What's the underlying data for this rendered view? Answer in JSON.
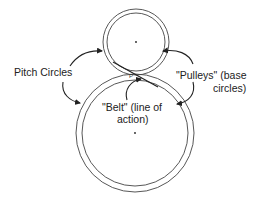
{
  "diagram": {
    "type": "gear pitch circles and base circles with line of action",
    "labels": {
      "pitch_circles": "Pitch Circles",
      "pulleys_line1": "\"Pulleys\" (base",
      "pulleys_line2": "circles)",
      "belt_line1": "\"Belt\" (line of",
      "belt_line2": "action)",
      "pitch_point": "P"
    },
    "colors": {
      "stroke": "#333333",
      "text": "#222222",
      "background": "#ffffff"
    },
    "shapes": {
      "small_gear": {
        "center": [
          136,
          42
        ],
        "pitch_radius": 33,
        "base_radius": 29
      },
      "large_gear": {
        "center": [
          135,
          133
        ],
        "pitch_radius": 59,
        "base_radius": 53
      }
    }
  }
}
